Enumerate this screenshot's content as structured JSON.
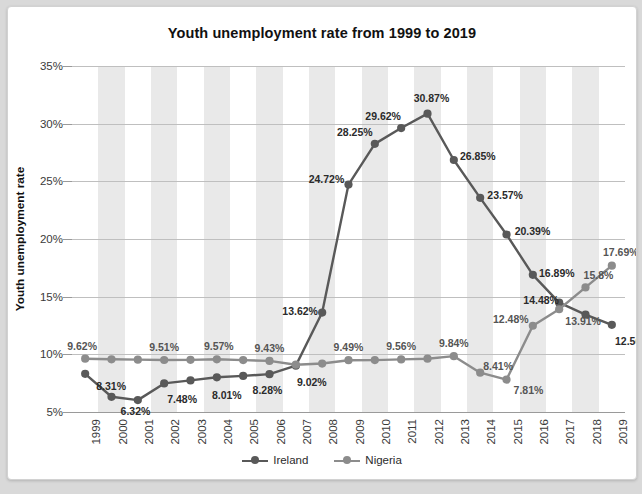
{
  "chart_data": {
    "type": "line",
    "title": "Youth unemployment rate from 1999 to 2019",
    "xlabel": "",
    "ylabel": "Youth unemployment rate",
    "ylim": [
      5,
      35
    ],
    "yticks": [
      "5%",
      "10%",
      "15%",
      "20%",
      "25%",
      "30%",
      "35%"
    ],
    "grid": true,
    "legend_position": "bottom",
    "categories": [
      "1999",
      "2000",
      "2001",
      "2002",
      "2003",
      "2004",
      "2005",
      "2006",
      "2007",
      "2008",
      "2009",
      "2010",
      "2011",
      "2012",
      "2013",
      "2014",
      "2015",
      "2016",
      "2017",
      "2018",
      "2019"
    ],
    "series": [
      {
        "name": "Ireland",
        "color": "#595959",
        "values": [
          8.31,
          6.32,
          6.03,
          7.48,
          7.74,
          8.01,
          8.13,
          8.28,
          9.02,
          13.62,
          24.72,
          28.25,
          29.62,
          30.87,
          26.85,
          23.57,
          20.39,
          16.89,
          14.48,
          13.45,
          12.56
        ],
        "labels": [
          "8.31%",
          "6.32%",
          "",
          "7.48%",
          "",
          "8.01%",
          "",
          "8.28%",
          "9.02%",
          "13.62%",
          "24.72%",
          "28.25%",
          "29.62%",
          "30.87%",
          "26.85%",
          "23.57%",
          "20.39%",
          "16.89%",
          "14.48%",
          "",
          "12.56%"
        ]
      },
      {
        "name": "Nigeria",
        "color": "#8c8c8c",
        "values": [
          9.62,
          9.57,
          9.54,
          9.51,
          9.52,
          9.57,
          9.5,
          9.43,
          9.1,
          9.2,
          9.49,
          9.5,
          9.56,
          9.62,
          9.84,
          8.41,
          7.81,
          12.48,
          13.91,
          15.8,
          17.69
        ],
        "labels": [
          "9.62%",
          "",
          "",
          "9.51%",
          "",
          "9.57%",
          "",
          "9.43%",
          "",
          "",
          "9.49%",
          "",
          "9.56%",
          "",
          "9.84%",
          "8.41%",
          "7.81%",
          "12.48%",
          "13.91%",
          "15.8%",
          "17.69%"
        ]
      }
    ]
  },
  "legend": {
    "items": [
      {
        "label": "Ireland"
      },
      {
        "label": "Nigeria"
      }
    ]
  }
}
